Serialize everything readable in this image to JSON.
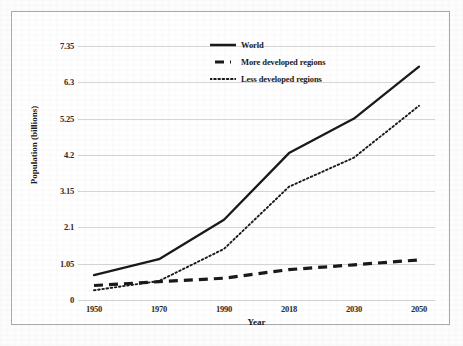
{
  "chart_data": {
    "type": "line",
    "title": "",
    "xlabel": "Year",
    "ylabel": "Population (billions)",
    "categories": [
      "1950",
      "1970",
      "1990",
      "2018",
      "2030",
      "2050"
    ],
    "ylim": [
      0,
      7.35
    ],
    "yticks": [
      "0",
      "1.05",
      "2.1",
      "3.15",
      "4.2",
      "5.25",
      "6.3",
      "7.35"
    ],
    "ytick_values": [
      0,
      1.05,
      2.1,
      3.15,
      4.2,
      5.25,
      6.3,
      7.35
    ],
    "grid": true,
    "legend_position": "top-center",
    "series": [
      {
        "name": "World",
        "style": "solid",
        "color": "#1a1a1a",
        "values": [
          0.72,
          1.18,
          2.32,
          4.25,
          5.25,
          6.75
        ]
      },
      {
        "name": "More developed regions",
        "style": "dashed",
        "color": "#1a1a1a",
        "values": [
          0.42,
          0.53,
          0.63,
          0.88,
          1.02,
          1.16
        ]
      },
      {
        "name": "Less developed regions",
        "style": "dotted",
        "color": "#1a1a1a",
        "values": [
          0.28,
          0.55,
          1.48,
          3.28,
          4.12,
          5.62
        ]
      }
    ]
  },
  "axes": {
    "x_title": "Year",
    "y_title": "Population (billions)"
  },
  "legend": {
    "items": [
      {
        "label": "World",
        "style": "solid"
      },
      {
        "label": "More developed regions",
        "style": "dashed"
      },
      {
        "label": "Less developed regions",
        "style": "dotted"
      }
    ]
  },
  "colors": {
    "line": "#1a1a1a",
    "grid": "#d6d6d6",
    "frame": "#a9a9a9",
    "text": "#1b1b1b",
    "background": "#ffffff"
  }
}
